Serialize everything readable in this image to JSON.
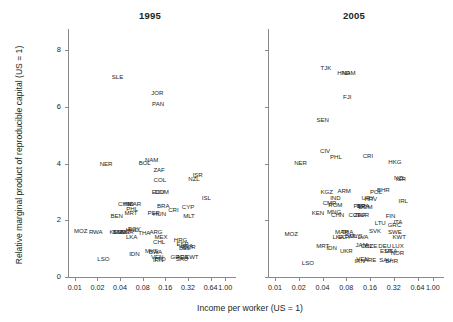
{
  "chart_data": {
    "type": "scatter",
    "title": "",
    "xlabel": "Income per worker (US = 1)",
    "ylabel": "Relative marginal product of reproducible capital (US = 1)",
    "xscale": "log2",
    "xticks": [
      "0.01",
      "0.02",
      "0.04",
      "0.08",
      "0.16",
      "0.32",
      "0.64",
      "1.00"
    ],
    "xtick_values": [
      0.01,
      0.02,
      0.04,
      0.08,
      0.16,
      0.32,
      0.64,
      1.0
    ],
    "yticks": [
      "0",
      "2",
      "4",
      "6",
      "8"
    ],
    "ytick_values": [
      0,
      2,
      4,
      6,
      8
    ],
    "ylim": [
      0,
      8.6
    ],
    "grid": false,
    "legend": null,
    "point_marker": "text-label-only",
    "panels": [
      {
        "title": "1995",
        "points": [
          {
            "label": "SLE",
            "x": 0.037,
            "y": 7.05
          },
          {
            "label": "JOR",
            "x": 0.125,
            "y": 6.5
          },
          {
            "label": "PAN",
            "x": 0.128,
            "y": 6.1
          },
          {
            "label": "NER",
            "x": 0.026,
            "y": 3.98
          },
          {
            "label": "BOL",
            "x": 0.085,
            "y": 4.02
          },
          {
            "label": "NAM",
            "x": 0.105,
            "y": 4.12
          },
          {
            "label": "ZAF",
            "x": 0.132,
            "y": 3.78
          },
          {
            "label": "ISR",
            "x": 0.43,
            "y": 3.58
          },
          {
            "label": "NZL",
            "x": 0.385,
            "y": 3.45
          },
          {
            "label": "COL",
            "x": 0.135,
            "y": 3.42
          },
          {
            "label": "ECU",
            "x": 0.128,
            "y": 2.98
          },
          {
            "label": "DOM",
            "x": 0.143,
            "y": 2.98
          },
          {
            "label": "ISL",
            "x": 0.56,
            "y": 2.78
          },
          {
            "label": "CHN",
            "x": 0.046,
            "y": 2.58
          },
          {
            "label": "IND",
            "x": 0.052,
            "y": 2.58
          },
          {
            "label": "MAR",
            "x": 0.062,
            "y": 2.58
          },
          {
            "label": "BRA",
            "x": 0.15,
            "y": 2.52
          },
          {
            "label": "CYP",
            "x": 0.32,
            "y": 2.45
          },
          {
            "label": "PHL",
            "x": 0.058,
            "y": 2.4
          },
          {
            "label": "CRI",
            "x": 0.205,
            "y": 2.35
          },
          {
            "label": "MRT",
            "x": 0.056,
            "y": 2.26
          },
          {
            "label": "PER",
            "x": 0.112,
            "y": 2.25
          },
          {
            "label": "HUN",
            "x": 0.134,
            "y": 2.22
          },
          {
            "label": "MLT",
            "x": 0.33,
            "y": 2.16
          },
          {
            "label": "BEN",
            "x": 0.036,
            "y": 2.14
          },
          {
            "label": "MOZ",
            "x": 0.012,
            "y": 1.62
          },
          {
            "label": "RWA",
            "x": 0.019,
            "y": 1.6
          },
          {
            "label": "KEN",
            "x": 0.035,
            "y": 1.6
          },
          {
            "label": "BGD",
            "x": 0.039,
            "y": 1.6
          },
          {
            "label": "MWI",
            "x": 0.044,
            "y": 1.6
          },
          {
            "label": "NGA",
            "x": 0.049,
            "y": 1.58
          },
          {
            "label": "EGY",
            "x": 0.062,
            "y": 1.68
          },
          {
            "label": "HND",
            "x": 0.058,
            "y": 1.66
          },
          {
            "label": "THA",
            "x": 0.084,
            "y": 1.55
          },
          {
            "label": "ARG",
            "x": 0.12,
            "y": 1.6
          },
          {
            "label": "LKA",
            "x": 0.057,
            "y": 1.42
          },
          {
            "label": "MEX",
            "x": 0.14,
            "y": 1.4
          },
          {
            "label": "CHL",
            "x": 0.132,
            "y": 1.22
          },
          {
            "label": "HRG",
            "x": 0.255,
            "y": 1.3
          },
          {
            "label": "ESP",
            "x": 0.27,
            "y": 1.15
          },
          {
            "label": "USA",
            "x": 0.31,
            "y": 1.08
          },
          {
            "label": "BEL",
            "x": 0.29,
            "y": 1.02
          },
          {
            "label": "NOR",
            "x": 0.33,
            "y": 1.05
          },
          {
            "label": "IDN",
            "x": 0.062,
            "y": 0.82
          },
          {
            "label": "LSO",
            "x": 0.024,
            "y": 0.62
          },
          {
            "label": "MYS",
            "x": 0.105,
            "y": 0.9
          },
          {
            "label": "BWA",
            "x": 0.118,
            "y": 0.88
          },
          {
            "label": "VEN",
            "x": 0.125,
            "y": 0.72
          },
          {
            "label": "TTO",
            "x": 0.135,
            "y": 0.62
          },
          {
            "label": "IRN",
            "x": 0.128,
            "y": 0.6
          },
          {
            "label": "GRC",
            "x": 0.23,
            "y": 0.72
          },
          {
            "label": "SAU",
            "x": 0.265,
            "y": 0.62
          },
          {
            "label": "ARE",
            "x": 0.27,
            "y": 0.7
          },
          {
            "label": "KWT",
            "x": 0.36,
            "y": 0.7
          }
        ]
      },
      {
        "title": "2005",
        "points": [
          {
            "label": "TJK",
            "x": 0.044,
            "y": 7.38
          },
          {
            "label": "HND",
            "x": 0.074,
            "y": 7.18
          },
          {
            "label": "NAM",
            "x": 0.086,
            "y": 7.18
          },
          {
            "label": "FJI",
            "x": 0.082,
            "y": 6.35
          },
          {
            "label": "SEN",
            "x": 0.04,
            "y": 5.55
          },
          {
            "label": "CIV",
            "x": 0.043,
            "y": 4.45
          },
          {
            "label": "PHL",
            "x": 0.059,
            "y": 4.22
          },
          {
            "label": "CRI",
            "x": 0.15,
            "y": 4.25
          },
          {
            "label": "HKG",
            "x": 0.33,
            "y": 4.05
          },
          {
            "label": "NER",
            "x": 0.021,
            "y": 4.02
          },
          {
            "label": "NZL",
            "x": 0.38,
            "y": 3.48
          },
          {
            "label": "ISR",
            "x": 0.392,
            "y": 3.45
          },
          {
            "label": "KGZ",
            "x": 0.045,
            "y": 2.98
          },
          {
            "label": "ARM",
            "x": 0.075,
            "y": 3.02
          },
          {
            "label": "POL",
            "x": 0.19,
            "y": 2.98
          },
          {
            "label": "BHR",
            "x": 0.235,
            "y": 3.05
          },
          {
            "label": "IND",
            "x": 0.058,
            "y": 2.78
          },
          {
            "label": "URY",
            "x": 0.15,
            "y": 2.78
          },
          {
            "label": "HRV",
            "x": 0.163,
            "y": 2.76
          },
          {
            "label": "IRL",
            "x": 0.42,
            "y": 2.68
          },
          {
            "label": "CMR",
            "x": 0.049,
            "y": 2.62
          },
          {
            "label": "ROM",
            "x": 0.058,
            "y": 2.55
          },
          {
            "label": "PER",
            "x": 0.118,
            "y": 2.52
          },
          {
            "label": "BRA",
            "x": 0.13,
            "y": 2.52
          },
          {
            "label": "DOM",
            "x": 0.14,
            "y": 2.45
          },
          {
            "label": "KEN",
            "x": 0.035,
            "y": 2.25
          },
          {
            "label": "MNG",
            "x": 0.056,
            "y": 2.28
          },
          {
            "label": "CHN",
            "x": 0.062,
            "y": 2.18
          },
          {
            "label": "COL",
            "x": 0.102,
            "y": 2.2
          },
          {
            "label": "ZAF",
            "x": 0.118,
            "y": 2.2
          },
          {
            "label": "TUR",
            "x": 0.13,
            "y": 2.2
          },
          {
            "label": "FIN",
            "x": 0.29,
            "y": 2.15
          },
          {
            "label": "ITA",
            "x": 0.36,
            "y": 1.95
          },
          {
            "label": "LTU",
            "x": 0.215,
            "y": 1.92
          },
          {
            "label": "GRC",
            "x": 0.325,
            "y": 1.82
          },
          {
            "label": "MOZ",
            "x": 0.016,
            "y": 1.52
          },
          {
            "label": "MAR",
            "x": 0.07,
            "y": 1.58
          },
          {
            "label": "THA",
            "x": 0.082,
            "y": 1.58
          },
          {
            "label": "SVK",
            "x": 0.185,
            "y": 1.62
          },
          {
            "label": "SWE",
            "x": 0.33,
            "y": 1.58
          },
          {
            "label": "LKA",
            "x": 0.063,
            "y": 1.42
          },
          {
            "label": "EGY",
            "x": 0.076,
            "y": 1.42
          },
          {
            "label": "BOL",
            "x": 0.092,
            "y": 1.45
          },
          {
            "label": "MYS",
            "x": 0.105,
            "y": 1.45
          },
          {
            "label": "LVA",
            "x": 0.13,
            "y": 1.42
          },
          {
            "label": "KWT",
            "x": 0.375,
            "y": 1.42
          },
          {
            "label": "MRT",
            "x": 0.04,
            "y": 1.1
          },
          {
            "label": "IDN",
            "x": 0.052,
            "y": 1.02
          },
          {
            "label": "UKR",
            "x": 0.08,
            "y": 0.92
          },
          {
            "label": "JAM",
            "x": 0.125,
            "y": 1.12
          },
          {
            "label": "CHL",
            "x": 0.145,
            "y": 1.1
          },
          {
            "label": "CZE",
            "x": 0.165,
            "y": 1.1
          },
          {
            "label": "DEU",
            "x": 0.245,
            "y": 1.08
          },
          {
            "label": "LUX",
            "x": 0.36,
            "y": 1.08
          },
          {
            "label": "ESP",
            "x": 0.255,
            "y": 0.92
          },
          {
            "label": "USA",
            "x": 0.295,
            "y": 0.9
          },
          {
            "label": "NOR",
            "x": 0.355,
            "y": 0.85
          },
          {
            "label": "VEN",
            "x": 0.128,
            "y": 0.62
          },
          {
            "label": "IRN",
            "x": 0.118,
            "y": 0.58
          },
          {
            "label": "ARE",
            "x": 0.16,
            "y": 0.6
          },
          {
            "label": "SAU",
            "x": 0.25,
            "y": 0.6
          },
          {
            "label": "BHR",
            "x": 0.3,
            "y": 0.58
          },
          {
            "label": "LSO",
            "x": 0.026,
            "y": 0.5
          }
        ]
      }
    ]
  }
}
